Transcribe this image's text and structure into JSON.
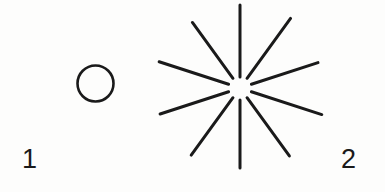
{
  "figure": {
    "background_color": "#fdfdfc",
    "ink_color": "#1a1a1a",
    "width": 385,
    "height": 192,
    "labels": {
      "left": "1",
      "right": "2"
    },
    "shapes": {
      "circle": {
        "name": "plain-circle",
        "center_x": 95.5,
        "center_y": 83.5,
        "radius": 18,
        "stroke_width": 2.6,
        "filled": false
      },
      "starburst": {
        "name": "ten-ray-starburst",
        "center_x": 240,
        "center_y": 88,
        "inner_radius": 11,
        "ray_count": 10,
        "stroke_width": 3.0,
        "rays": [
          {
            "angle_deg": -90,
            "inner": 11,
            "outer": 83,
            "label": "ray-top"
          },
          {
            "angle_deg": -54,
            "inner": 12,
            "outer": 86,
            "label": "ray-upper-right"
          },
          {
            "angle_deg": -18,
            "inner": 12,
            "outer": 82,
            "label": "ray-right-upper"
          },
          {
            "angle_deg": 18,
            "inner": 12,
            "outer": 86,
            "label": "ray-right-lower"
          },
          {
            "angle_deg": 54,
            "inner": 12,
            "outer": 84,
            "label": "ray-lower-right"
          },
          {
            "angle_deg": 90,
            "inner": 12,
            "outer": 80,
            "label": "ray-bottom"
          },
          {
            "angle_deg": 126,
            "inner": 12,
            "outer": 83,
            "label": "ray-lower-left"
          },
          {
            "angle_deg": 162,
            "inner": 12,
            "outer": 84,
            "label": "ray-left-lower"
          },
          {
            "angle_deg": 198,
            "inner": 12,
            "outer": 85,
            "label": "ray-left-upper"
          },
          {
            "angle_deg": 234,
            "inner": 12,
            "outer": 81,
            "label": "ray-upper-left"
          }
        ]
      }
    }
  }
}
